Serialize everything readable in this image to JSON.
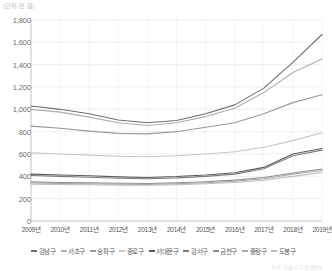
{
  "unit_label": "(단위: 만 원)",
  "source_label": "자료: 서울시 부동산정보",
  "axis": {
    "y_ticks": [
      "1,800",
      "1,600",
      "1,400",
      "1,200",
      "1,000",
      "800",
      "600",
      "400",
      "200",
      "0"
    ],
    "x_ticks": [
      "2009년",
      "2010년",
      "2011년",
      "2012년",
      "2013년",
      "2014년",
      "2015년",
      "2016년",
      "2017년",
      "2018년",
      "2019년"
    ]
  },
  "chart_data": {
    "type": "line",
    "title": "",
    "xlabel": "",
    "ylabel": "",
    "unit": "만 원",
    "grid": true,
    "legend_position": "bottom",
    "ylim": [
      0,
      1800
    ],
    "ytick_step": 200,
    "categories": [
      "2009년",
      "2010년",
      "2011년",
      "2012년",
      "2013년",
      "2014년",
      "2015년",
      "2016년",
      "2017년",
      "2018년",
      "2019년"
    ],
    "series": [
      {
        "name": "강남구",
        "color": "#6f6f6f",
        "values": [
          1030,
          1000,
          960,
          905,
          880,
          900,
          960,
          1040,
          1190,
          1420,
          1670
        ]
      },
      {
        "name": "서초구",
        "color": "#aeaeae",
        "values": [
          1000,
          975,
          930,
          880,
          855,
          880,
          935,
          1010,
          1150,
          1330,
          1450
        ]
      },
      {
        "name": "송파구",
        "color": "#9a9a9a",
        "values": [
          850,
          830,
          805,
          785,
          780,
          800,
          840,
          880,
          960,
          1060,
          1130
        ]
      },
      {
        "name": "종로구",
        "color": "#c6c6c6",
        "values": [
          610,
          600,
          590,
          580,
          575,
          585,
          600,
          620,
          660,
          720,
          790
        ]
      },
      {
        "name": "서대문구",
        "color": "#5a5a5a",
        "values": [
          420,
          412,
          405,
          395,
          390,
          398,
          412,
          432,
          480,
          600,
          650
        ]
      },
      {
        "name": "강서구",
        "color": "#7c7c7c",
        "values": [
          408,
          400,
          392,
          383,
          378,
          386,
          400,
          420,
          468,
          585,
          635
        ]
      },
      {
        "name": "금천구",
        "color": "#8e8e8e",
        "values": [
          350,
          345,
          342,
          338,
          336,
          342,
          352,
          366,
          390,
          430,
          465
        ]
      },
      {
        "name": "중랑구",
        "color": "#a6a6a6",
        "values": [
          340,
          336,
          333,
          330,
          328,
          334,
          343,
          356,
          378,
          418,
          452
        ]
      },
      {
        "name": "도봉구",
        "color": "#bdbdbd",
        "values": [
          330,
          327,
          324,
          321,
          320,
          325,
          333,
          345,
          365,
          400,
          435
        ]
      }
    ]
  }
}
